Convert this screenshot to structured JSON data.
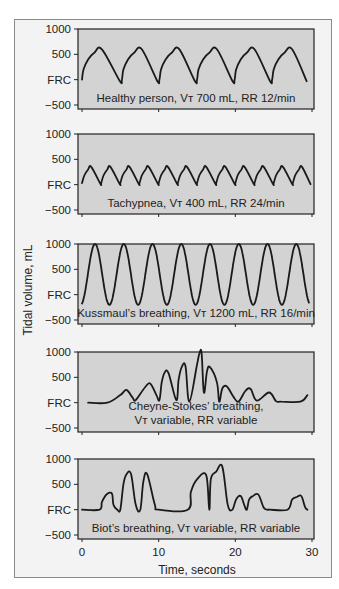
{
  "chart_data": {
    "type": "line",
    "title": "",
    "xlabel": "Time, seconds",
    "ylabel": "Tidal volume, mL",
    "xlim": [
      0,
      30
    ],
    "x_ticks": [
      0,
      10,
      20,
      30
    ],
    "ylim": [
      -500,
      1000
    ],
    "y_ticks": [
      {
        "value": 1000,
        "label": "1000"
      },
      {
        "value": 500,
        "label": "500"
      },
      {
        "value": 0,
        "label": "FRC"
      },
      {
        "value": -500,
        "label": "−500"
      }
    ],
    "grid": false,
    "colors": {
      "panel_fill": "#d3d3d3",
      "trace": "#1a1a1a",
      "frame": "#f3f3f3"
    },
    "panels": [
      {
        "name": "Healthy person",
        "label_lines": [
          "Healthy person, Vᴛ 700 mL, RR 12/min"
        ],
        "tidal_volume_ml": 700,
        "rate_per_min": 12,
        "series": {
          "x": [
            0,
            0.2,
            0.8,
            1.6,
            2.6,
            4.9,
            5.2,
            5.4,
            6.0,
            6.8,
            7.8,
            9.8,
            10.1,
            10.3,
            10.9,
            11.7,
            12.7,
            14.7,
            15.0,
            15.2,
            15.8,
            16.6,
            17.6,
            19.6,
            19.9,
            20.1,
            20.7,
            21.5,
            22.5,
            24.5,
            24.8,
            25.0,
            25.6,
            26.4,
            27.4,
            29.3
          ],
          "y": [
            0,
            200,
            400,
            530,
            600,
            -20,
            0,
            200,
            400,
            530,
            600,
            -20,
            0,
            200,
            400,
            530,
            600,
            -20,
            0,
            200,
            400,
            530,
            600,
            -20,
            0,
            200,
            400,
            530,
            600,
            -20,
            0,
            200,
            400,
            530,
            600,
            -30
          ]
        }
      },
      {
        "name": "Tachypnea",
        "label_lines": [
          "Tachypnea, Vᴛ 400 mL, RR 24/min"
        ],
        "tidal_volume_ml": 400,
        "rate_per_min": 24,
        "series": {
          "x": [
            0,
            0.3,
            0.8,
            1.2,
            2.4,
            2.5,
            2.8,
            3.3,
            3.7,
            4.9,
            5.0,
            5.3,
            5.8,
            6.2,
            7.4,
            7.5,
            7.8,
            8.3,
            8.7,
            9.9,
            10.0,
            10.3,
            10.8,
            11.2,
            12.4,
            12.5,
            12.8,
            13.3,
            13.7,
            14.9,
            15.0,
            15.3,
            15.8,
            16.2,
            17.4,
            17.5,
            17.8,
            18.3,
            18.7,
            19.9,
            20.0,
            20.3,
            20.8,
            21.2,
            22.4,
            22.5,
            22.8,
            23.3,
            23.7,
            24.9,
            25.0,
            25.3,
            25.8,
            26.2,
            27.4,
            27.5,
            27.8,
            28.3,
            28.7,
            29.8
          ],
          "y": [
            30,
            180,
            300,
            350,
            20,
            30,
            180,
            300,
            350,
            20,
            30,
            180,
            300,
            350,
            20,
            30,
            180,
            300,
            350,
            20,
            30,
            180,
            300,
            350,
            20,
            30,
            180,
            300,
            350,
            20,
            30,
            180,
            300,
            350,
            20,
            30,
            180,
            300,
            350,
            20,
            30,
            180,
            300,
            350,
            20,
            30,
            180,
            300,
            350,
            20,
            30,
            180,
            300,
            350,
            20,
            30,
            180,
            300,
            350,
            10
          ]
        }
      },
      {
        "name": "Kussmaul's breathing",
        "label_lines": [
          "Kussmaul’s breathing, Vᴛ 1200 mL, RR 16/min"
        ],
        "tidal_volume_ml": 1200,
        "rate_per_min": 16,
        "series": {
          "generator": "sine",
          "x_start": 0,
          "x_end": 29.6,
          "period_s": 3.75,
          "phase_start_s": 0,
          "min": -200,
          "max": 1000,
          "first_peak_s": 1.7
        }
      },
      {
        "name": "Cheyne-Stokes' breathing",
        "label_lines": [
          "Cheyne-Stokes’ breathing,",
          "Vᴛ variable, RR variable"
        ],
        "tidal_volume_ml": "variable",
        "rate_per_min": "variable",
        "series": {
          "x": [
            0.8,
            3.3,
            5.0,
            5.8,
            6.6,
            7.0,
            8.2,
            8.9,
            9.7,
            10.1,
            10.4,
            10.8,
            11.3,
            12.3,
            12.6,
            13.0,
            13.5,
            14.0,
            15.0,
            15.3,
            15.6,
            15.9,
            16.3,
            16.7,
            17.6,
            17.9,
            18.3,
            18.9,
            19.7,
            20.4,
            21.3,
            22.0,
            22.8,
            24.4,
            25.3,
            26.0,
            28.5,
            29.4
          ],
          "y": [
            0,
            0,
            150,
            250,
            100,
            50,
            300,
            380,
            150,
            50,
            400,
            600,
            580,
            50,
            450,
            700,
            720,
            20,
            750,
            960,
            980,
            200,
            620,
            700,
            400,
            20,
            280,
            320,
            130,
            20,
            230,
            270,
            40,
            200,
            30,
            20,
            20,
            150
          ]
        }
      },
      {
        "name": "Biot's breathing",
        "label_lines": [
          "Biot’s breathing, Vᴛ variable, RR variable"
        ],
        "tidal_volume_ml": "variable",
        "rate_per_min": "variable",
        "series": {
          "x": [
            0,
            2.3,
            2.6,
            3.2,
            3.9,
            4.1,
            4.6,
            5.0,
            5.4,
            5.8,
            6.4,
            7.0,
            7.6,
            8.0,
            8.5,
            9.5,
            10.0,
            13.8,
            14.2,
            15.0,
            16.2,
            16.6,
            16.8,
            17.5,
            18.3,
            19.0,
            19.6,
            20.1,
            20.7,
            21.2,
            21.5,
            21.8,
            22.3,
            23.0,
            23.7,
            24.2,
            24.5,
            26.8,
            27.4,
            28.0,
            28.6,
            29.1,
            29.4
          ],
          "y": [
            0,
            0,
            150,
            300,
            320,
            100,
            0,
            0,
            500,
            700,
            700,
            100,
            0,
            550,
            700,
            100,
            0,
            0,
            350,
            600,
            680,
            0,
            600,
            750,
            850,
            100,
            0,
            200,
            270,
            80,
            0,
            200,
            270,
            300,
            40,
            0,
            0,
            0,
            200,
            250,
            270,
            50,
            0
          ]
        }
      }
    ]
  }
}
